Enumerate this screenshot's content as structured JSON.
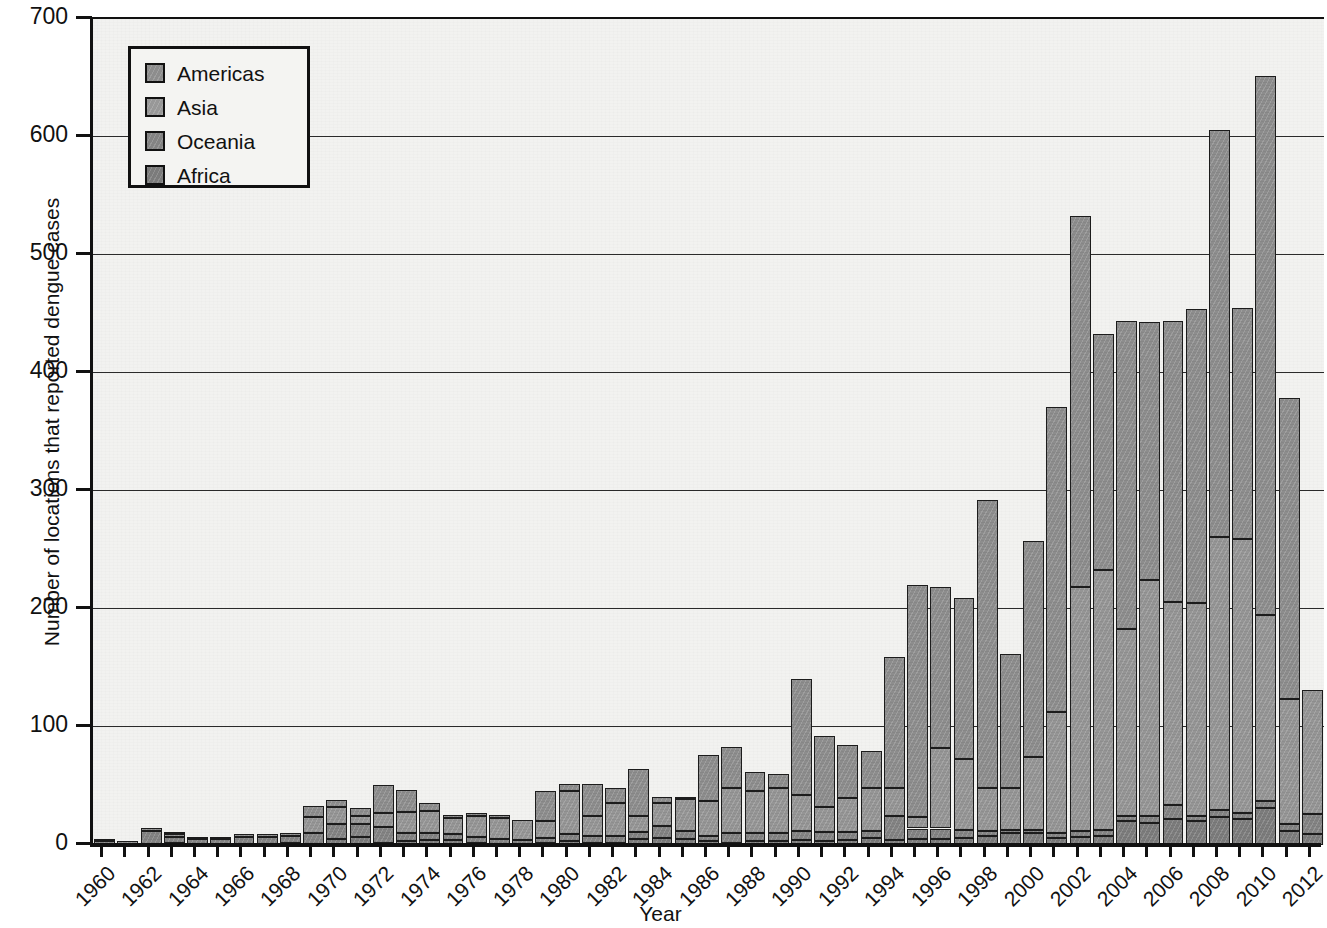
{
  "chart_data": {
    "type": "bar",
    "stacked": true,
    "title": "",
    "xlabel": "Year",
    "ylabel": "Number of locations that reported dengue cases",
    "ylim": [
      0,
      700
    ],
    "ytick_step": 100,
    "yticks": [
      0,
      100,
      200,
      300,
      400,
      500,
      600,
      700
    ],
    "ytick_labels": [
      "0",
      "100",
      "200",
      "300",
      "400",
      "500",
      "600",
      "700"
    ],
    "grid": "horizontal",
    "legend_position": "upper-left-inside",
    "xtick_step": 2,
    "x": [
      1960,
      1961,
      1962,
      1963,
      1964,
      1965,
      1966,
      1967,
      1968,
      1969,
      1970,
      1971,
      1972,
      1973,
      1974,
      1975,
      1976,
      1977,
      1978,
      1979,
      1980,
      1981,
      1982,
      1983,
      1984,
      1985,
      1986,
      1987,
      1988,
      1989,
      1990,
      1991,
      1992,
      1993,
      1994,
      1995,
      1996,
      1997,
      1998,
      1999,
      2000,
      2001,
      2002,
      2003,
      2004,
      2005,
      2006,
      2007,
      2008,
      2009,
      2010,
      2011,
      2012
    ],
    "xtick_labels": [
      "1960",
      "1962",
      "1964",
      "1966",
      "1968",
      "1970",
      "1972",
      "1974",
      "1976",
      "1978",
      "1980",
      "1982",
      "1984",
      "1986",
      "1988",
      "1990",
      "1992",
      "1994",
      "1996",
      "1998",
      "2000",
      "2002",
      "2004",
      "2006",
      "2008",
      "2010",
      "2012"
    ],
    "series": [
      {
        "name": "Africa",
        "color": "#7c7c7c",
        "values": [
          0,
          0,
          1,
          2,
          1,
          0,
          1,
          1,
          2,
          1,
          5,
          7,
          2,
          3,
          4,
          4,
          2,
          1,
          1,
          2,
          3,
          2,
          2,
          5,
          6,
          5,
          3,
          2,
          3,
          3,
          4,
          3,
          4,
          6,
          4,
          5,
          5,
          6,
          8,
          10,
          10,
          6,
          7,
          8,
          20,
          19,
          22,
          20,
          24,
          22,
          31,
          12,
          9
        ]
      },
      {
        "name": "Oceania",
        "color": "#838383",
        "values": [
          3,
          1,
          11,
          5,
          4,
          5,
          6,
          6,
          6,
          9,
          13,
          11,
          13,
          7,
          6,
          5,
          5,
          4,
          3,
          4,
          6,
          6,
          6,
          6,
          10,
          7,
          5,
          8,
          7,
          7,
          8,
          8,
          7,
          6,
          21,
          9,
          9,
          7,
          4,
          3,
          3,
          4,
          5,
          5,
          5,
          6,
          12,
          5,
          6,
          5,
          6,
          6,
          17
        ]
      },
      {
        "name": "Asia",
        "color": "#959595",
        "values": [
          1,
          1,
          1,
          2,
          2,
          2,
          2,
          2,
          2,
          14,
          14,
          7,
          12,
          18,
          19,
          14,
          18,
          18,
          17,
          14,
          37,
          17,
          28,
          14,
          20,
          27,
          29,
          38,
          36,
          38,
          30,
          21,
          29,
          36,
          23,
          10,
          68,
          60,
          36,
          35,
          62,
          103,
          207,
          220,
          158,
          200,
          172,
          180,
          231,
          232,
          158,
          106,
          105
        ]
      },
      {
        "name": "Americas",
        "color": "#8d8d8d",
        "values": [
          0,
          0,
          0,
          2,
          0,
          0,
          0,
          0,
          0,
          9,
          6,
          6,
          24,
          19,
          7,
          2,
          2,
          1,
          0,
          26,
          6,
          27,
          12,
          39,
          5,
          1,
          39,
          35,
          16,
          12,
          99,
          60,
          45,
          32,
          111,
          196,
          137,
          136,
          244,
          114,
          183,
          258,
          314,
          200,
          261,
          218,
          238,
          249,
          345,
          196,
          457,
          255,
          0
        ]
      }
    ],
    "totals": [
      4,
      2,
      13,
      11,
      7,
      7,
      9,
      9,
      10,
      33,
      38,
      31,
      51,
      47,
      36,
      25,
      27,
      24,
      21,
      46,
      52,
      52,
      48,
      64,
      41,
      40,
      76,
      83,
      62,
      60,
      141,
      92,
      85,
      80,
      159,
      220,
      219,
      209,
      292,
      162,
      258,
      371,
      533,
      433,
      444,
      443,
      444,
      454,
      606,
      455,
      652,
      379,
      131
    ]
  },
  "legend": {
    "items": [
      {
        "label": "Americas",
        "key": "americas"
      },
      {
        "label": "Asia",
        "key": "asia"
      },
      {
        "label": "Oceania",
        "key": "oceania"
      },
      {
        "label": "Africa",
        "key": "africa"
      }
    ]
  },
  "axes": {
    "y_title": "Number of locations that reported dengue cases",
    "x_title": "Year"
  }
}
